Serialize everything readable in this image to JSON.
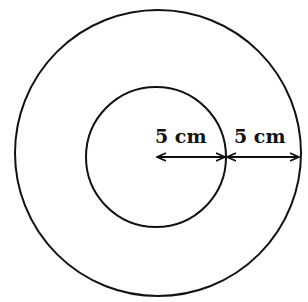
{
  "diagram": {
    "type": "concentric-circles",
    "outer_circle": {
      "cx": 158,
      "cy": 153,
      "r": 143
    },
    "inner_circle": {
      "cx": 156,
      "cy": 157,
      "r": 70
    },
    "labels": {
      "inner_radius": "5 cm",
      "ring_width": "5 cm"
    },
    "stroke_color": "#111111",
    "background": "#ffffff"
  }
}
